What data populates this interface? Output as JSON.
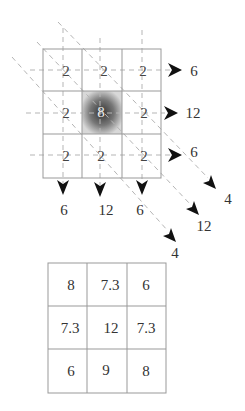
{
  "top_grid": {
    "cells": [
      [
        "2",
        "2",
        "2"
      ],
      [
        "2",
        "8",
        "2"
      ],
      [
        "2",
        "2",
        "2"
      ]
    ],
    "highlighted_cell": {
      "row": 1,
      "col": 1,
      "color": "#555555"
    }
  },
  "row_sums": [
    "6",
    "12",
    "6"
  ],
  "column_sums": [
    "6",
    "12",
    "6"
  ],
  "diagonal_sums": [
    "4",
    "12",
    "4"
  ],
  "bottom_grid": {
    "cells": [
      [
        "8",
        "7.3",
        "6"
      ],
      [
        "7.3",
        "12",
        "7.3"
      ],
      [
        "6",
        "9",
        "8"
      ]
    ]
  }
}
